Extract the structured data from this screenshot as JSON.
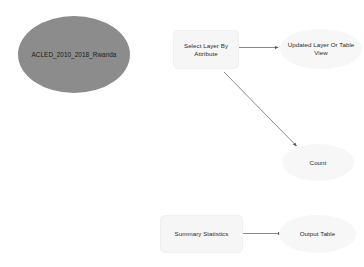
{
  "diagram": {
    "canvas": {
      "width": 364,
      "height": 267,
      "background": "#ffffff"
    },
    "colors": {
      "input_fill": "#8c8c8c",
      "tool_fill": "#f6f6f6",
      "output_fill": "#f7f7f7",
      "text": "#2b2b2b",
      "connector": "#595959"
    },
    "nodes": [
      {
        "id": "input_layer",
        "label": "ACLED_2010_2018_Rwanda",
        "shape": "ellipse",
        "role": "input-data"
      },
      {
        "id": "select_layer_by_attribute",
        "label": "Select Layer By Attribute",
        "shape": "rounded-rect",
        "role": "tool"
      },
      {
        "id": "updated_layer_or_table_view",
        "label": "Updated Layer Or Table View",
        "shape": "ellipse",
        "role": "derived-data"
      },
      {
        "id": "count",
        "label": "Count",
        "shape": "ellipse",
        "role": "derived-data"
      },
      {
        "id": "summary_statistics",
        "label": "Summary Statistics",
        "shape": "rounded-rect",
        "role": "tool"
      },
      {
        "id": "output_table",
        "label": "Output Table",
        "shape": "ellipse",
        "role": "derived-data"
      }
    ],
    "connectors": [
      {
        "id": "c1",
        "from": "select_layer_by_attribute",
        "to": "updated_layer_or_table_view",
        "style": "arrow"
      },
      {
        "id": "c2",
        "from": "select_layer_by_attribute",
        "to": "count",
        "style": "arrow"
      },
      {
        "id": "c3",
        "from": "summary_statistics",
        "to": "output_table",
        "style": "arrow"
      }
    ]
  }
}
